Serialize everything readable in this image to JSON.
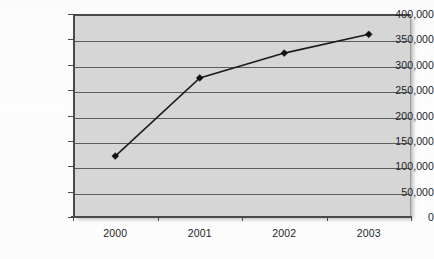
{
  "chart_data": {
    "type": "line",
    "title": "",
    "subtitle": "",
    "xlabel": "",
    "ylabel": "",
    "categories": [
      "2000",
      "2001",
      "2002",
      "2003"
    ],
    "series": [
      {
        "name": "",
        "values": [
          120000,
          274000,
          323000,
          360000
        ]
      }
    ],
    "ylim": [
      0,
      400000
    ],
    "ytick_values": [
      0,
      50000,
      100000,
      150000,
      200000,
      250000,
      300000,
      350000,
      400000
    ],
    "ytick_labels": [
      "0",
      "50,000",
      "100,000",
      "150,000",
      "200,000",
      "250,000",
      "300,000",
      "350,000",
      "400,000"
    ],
    "grid": true,
    "grid_axis": "y",
    "legend": false,
    "legend_position": "none",
    "marker": "diamond",
    "annotations": []
  },
  "style": {
    "plot_background": "#d6d6d6",
    "page_background": "#fdfdfd",
    "gridline_color": "#5d5d5d",
    "axis_color": "#4a4a4a",
    "series_color": "#1c1c1c",
    "text_color": "#23242a"
  }
}
